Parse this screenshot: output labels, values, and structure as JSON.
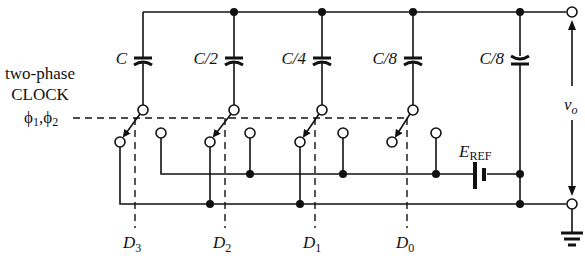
{
  "clock": {
    "line1": "two-phase",
    "line2": "CLOCK",
    "phases": "ϕ",
    "phase1_sub": "1",
    "sep": ",",
    "phase2_sub": "2"
  },
  "capacitors": [
    {
      "label": "C"
    },
    {
      "label": "C/2"
    },
    {
      "label": "C/4"
    },
    {
      "label": "C/8"
    },
    {
      "label": "C/8"
    }
  ],
  "bits": [
    {
      "letter": "D",
      "sub": "3"
    },
    {
      "letter": "D",
      "sub": "2"
    },
    {
      "letter": "D",
      "sub": "1"
    },
    {
      "letter": "D",
      "sub": "0"
    }
  ],
  "reference": {
    "letter": "E",
    "sub": "REF"
  },
  "output": {
    "letter": "v",
    "sub": "o"
  },
  "colors": {
    "ink": "#111111",
    "background": "#ffffff"
  }
}
